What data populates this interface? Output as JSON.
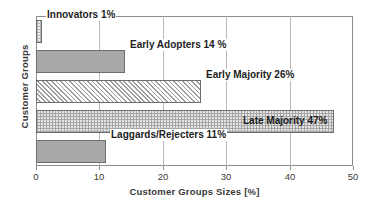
{
  "chart_data": {
    "type": "bar",
    "orientation": "horizontal",
    "title": "",
    "xlabel": "Customer Groups Sizes [%]",
    "ylabel": "Customer Groups",
    "categories": [
      "Innovators",
      "Early Adopters",
      "Early Majority",
      "Late Majority",
      "Laggards/Rejecters"
    ],
    "values": [
      1,
      14,
      26,
      47,
      11
    ],
    "xlim": [
      0,
      50
    ],
    "xticks": [
      0,
      10,
      20,
      30,
      40,
      50
    ],
    "xtick_labels": [
      "0",
      "10",
      "20",
      "30",
      "40",
      "50"
    ],
    "grid": true,
    "legend": "none",
    "data_labels": [
      "Innovators 1%",
      "Early Adopters 14 %",
      "Early Majority 26%",
      "Late Majority 47%",
      "Laggards/Rejecters 11%"
    ],
    "label_placement": [
      "outside",
      "outside",
      "outside",
      "inside",
      "outside"
    ],
    "bar_fills": [
      "dots",
      "solid",
      "hatch",
      "checker",
      "solid"
    ],
    "colors": {
      "bar_solid": "#a8a8a8",
      "bar_edge": "#6e6e6e",
      "axis": "#8c8c8c",
      "gridline": "#b9b9b9",
      "text": "#3a3a3a",
      "label_text": "#1d1d1d",
      "background": "#ffffff"
    }
  }
}
